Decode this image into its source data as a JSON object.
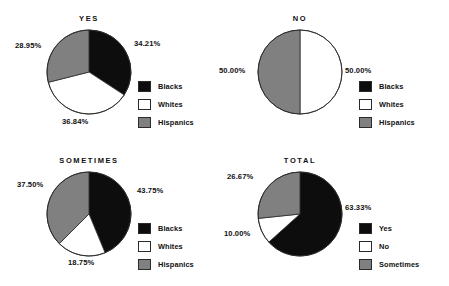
{
  "figure": {
    "background": "#ffffff",
    "width": 449,
    "height": 286
  },
  "colors": {
    "black": "#0d0d0d",
    "white": "#ffffff",
    "gray": "#808080",
    "stroke": "#2a2a2a",
    "text": "#111111"
  },
  "chart_data": [
    {
      "type": "pie",
      "title": "YES",
      "labels": [
        "Blacks",
        "Whites",
        "Hispanics"
      ],
      "values": [
        34.21,
        36.84,
        28.95
      ],
      "value_labels": [
        "34.21%",
        "36.84%",
        "28.95%"
      ],
      "colors": [
        "#0d0d0d",
        "#ffffff",
        "#808080"
      ],
      "start_angle_deg": 0,
      "direction": "clockwise",
      "legend": {
        "position": "right",
        "entries": [
          {
            "label": "Blacks",
            "color": "#0d0d0d"
          },
          {
            "label": "Whites",
            "color": "#ffffff"
          },
          {
            "label": "Hispanics",
            "color": "#808080"
          }
        ]
      }
    },
    {
      "type": "pie",
      "title": "NO",
      "labels": [
        "Blacks",
        "Whites",
        "Hispanics"
      ],
      "values": [
        0.0,
        50.0,
        50.0
      ],
      "value_labels": [
        "",
        "50.00%",
        "50.00%"
      ],
      "colors": [
        "#0d0d0d",
        "#ffffff",
        "#808080"
      ],
      "start_angle_deg": 0,
      "direction": "clockwise",
      "legend": {
        "position": "right",
        "entries": [
          {
            "label": "Blacks",
            "color": "#0d0d0d"
          },
          {
            "label": "Whites",
            "color": "#ffffff"
          },
          {
            "label": "Hispanics",
            "color": "#808080"
          }
        ]
      }
    },
    {
      "type": "pie",
      "title": "SOMETIMES",
      "labels": [
        "Blacks",
        "Whites",
        "Hispanics"
      ],
      "values": [
        43.75,
        18.75,
        37.5
      ],
      "value_labels": [
        "43.75%",
        "18.75%",
        "37.50%"
      ],
      "colors": [
        "#0d0d0d",
        "#ffffff",
        "#808080"
      ],
      "start_angle_deg": 0,
      "direction": "clockwise",
      "legend": {
        "position": "right",
        "entries": [
          {
            "label": "Blacks",
            "color": "#0d0d0d"
          },
          {
            "label": "Whites",
            "color": "#ffffff"
          },
          {
            "label": "Hispanics",
            "color": "#808080"
          }
        ]
      }
    },
    {
      "type": "pie",
      "title": "TOTAL",
      "labels": [
        "Yes",
        "No",
        "Sometimes"
      ],
      "values": [
        63.33,
        10.0,
        26.67
      ],
      "value_labels": [
        "63.33%",
        "10.00%",
        "26.67%"
      ],
      "colors": [
        "#0d0d0d",
        "#ffffff",
        "#808080"
      ],
      "start_angle_deg": 0,
      "direction": "clockwise",
      "legend": {
        "position": "right",
        "entries": [
          {
            "label": "Yes",
            "color": "#0d0d0d"
          },
          {
            "label": "No",
            "color": "#ffffff"
          },
          {
            "label": "Sometimes",
            "color": "#808080"
          }
        ]
      }
    }
  ],
  "panels": [
    {
      "name": "yes",
      "title": "YES",
      "pie": {
        "cx": 89,
        "cy": 72,
        "r": 42
      },
      "labels": [
        {
          "text": "34.21%",
          "x": 134,
          "y": 39,
          "align": "left"
        },
        {
          "text": "36.84%",
          "x": 62,
          "y": 117,
          "align": "left"
        },
        {
          "text": "28.95%",
          "x": 15,
          "y": 41,
          "align": "left"
        }
      ],
      "legend_pos": {
        "x": 138,
        "y": 79
      }
    },
    {
      "name": "no",
      "title": "NO",
      "pie": {
        "cx": 300,
        "cy": 72,
        "r": 42
      },
      "labels": [
        {
          "text": "50.00%",
          "x": 345,
          "y": 66,
          "align": "left"
        },
        {
          "text": "50.00%",
          "x": 219,
          "y": 66,
          "align": "left"
        }
      ],
      "legend_pos": {
        "x": 359,
        "y": 79
      }
    },
    {
      "name": "sometimes",
      "title": "SOMETIMES",
      "pie": {
        "cx": 89,
        "cy": 214,
        "r": 42
      },
      "labels": [
        {
          "text": "43.75%",
          "x": 137,
          "y": 186,
          "align": "left"
        },
        {
          "text": "18.75%",
          "x": 68,
          "y": 258,
          "align": "left"
        },
        {
          "text": "37.50%",
          "x": 17,
          "y": 180,
          "align": "left"
        }
      ],
      "legend_pos": {
        "x": 138,
        "y": 221
      }
    },
    {
      "name": "total",
      "title": "TOTAL",
      "pie": {
        "cx": 300,
        "cy": 214,
        "r": 42
      },
      "labels": [
        {
          "text": "63.33%",
          "x": 345,
          "y": 203,
          "align": "left"
        },
        {
          "text": "10.00%",
          "x": 224,
          "y": 229,
          "align": "left"
        },
        {
          "text": "26.67%",
          "x": 227,
          "y": 172,
          "align": "left"
        }
      ],
      "legend_pos": {
        "x": 359,
        "y": 221
      }
    }
  ]
}
